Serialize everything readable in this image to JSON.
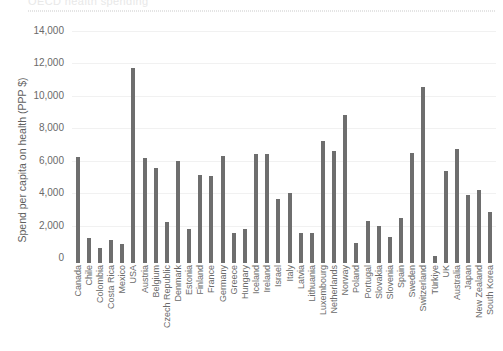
{
  "top_strip": {
    "ghost_title": "OECD health spending",
    "note": "partially cropped header above chart"
  },
  "chart_data": {
    "type": "bar",
    "title": "",
    "xlabel": "",
    "ylabel": "Spend per capita on health (PPP $)",
    "ylim": [
      0,
      14000
    ],
    "ytick_labels": [
      "14,000",
      "12,000",
      "10,000",
      "8,000",
      "6,000",
      "4,000",
      "2,000",
      "0"
    ],
    "ytick_values": [
      14000,
      12000,
      10000,
      8000,
      6000,
      4000,
      2000,
      0
    ],
    "grid": true,
    "legend": null,
    "bar_color": "#6e6e6e",
    "categories": [
      "Canada",
      "Chile",
      "Colombia",
      "Costa Rica",
      "Mexico",
      "USA",
      "Austria",
      "Belgium",
      "Czech Republic",
      "Denmark",
      "Estonia",
      "Finland",
      "France",
      "Germany",
      "Greece",
      "Hungary",
      "Iceland",
      "Ireland",
      "Israel",
      "Italy",
      "Latvia",
      "Lithuania",
      "Luxembourg",
      "Netherlands",
      "Norway",
      "Poland",
      "Portugal",
      "Slovakia",
      "Slovenia",
      "Spain",
      "Sweden",
      "Switzerland",
      "Türkiye",
      "UK",
      "Australia",
      "Japan",
      "New Zealand",
      "South Korea"
    ],
    "values": [
      6530,
      1540,
      900,
      1450,
      1180,
      12000,
      6460,
      5850,
      2530,
      6270,
      2110,
      5450,
      5380,
      6600,
      1830,
      2100,
      6750,
      6730,
      3930,
      4300,
      1880,
      1870,
      7550,
      6910,
      9120,
      1260,
      2620,
      2280,
      1590,
      2760,
      6780,
      10880,
      460,
      5650,
      7050,
      4190,
      4530,
      3150
    ]
  }
}
